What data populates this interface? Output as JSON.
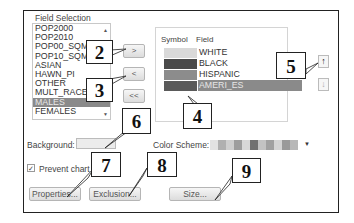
{
  "dialog": {
    "group_title": "Field Selection",
    "available_fields": [
      "POP2000",
      "POP2010",
      "POP00_SQMI",
      "POP10_SQMI",
      "ASIAN",
      "HAWN_PI",
      "OTHER",
      "MULT_RACE",
      "MALES",
      "FEMALES"
    ],
    "available_selected_index": 8,
    "buttons": {
      "add": ">",
      "remove": "<",
      "remove_all": "<<",
      "move_up": "↑",
      "move_down": "↓",
      "properties": "Properties...",
      "exclusion": "Exclusion...",
      "size": "Size..."
    },
    "symbol_table": {
      "headers": {
        "symbol": "Symbol",
        "field": "Field"
      },
      "rows": [
        {
          "field": "WHITE",
          "color": "#d9d9d9",
          "selected": false
        },
        {
          "field": "BLACK",
          "color": "#4a4a4a",
          "selected": false
        },
        {
          "field": "HISPANIC",
          "color": "#8c8c8c",
          "selected": false
        },
        {
          "field": "AMERI_ES",
          "color": "#5a5a5a",
          "selected": true
        }
      ]
    },
    "background_label": "Background:",
    "background_color": "#ececec",
    "color_scheme_label": "Color Scheme:",
    "color_scheme_colors": [
      "#e2e2e2",
      "#b0b0b0",
      "#cfcfcf",
      "#9e9e9e",
      "#d8d8d8",
      "#707070",
      "#c2c2c2",
      "#a0a0a0",
      "#d4d4d4",
      "#9a9a9a",
      "#b8b8b8"
    ],
    "prevent_chart_label": "Prevent chart o",
    "prevent_chart_checked": true
  },
  "callouts": [
    "2",
    "3",
    "4",
    "5",
    "6",
    "7",
    "8",
    "9"
  ],
  "icons": {
    "scroll_up": "▲",
    "scroll_down": "▼",
    "dropdown": "▼",
    "check": "✓"
  }
}
